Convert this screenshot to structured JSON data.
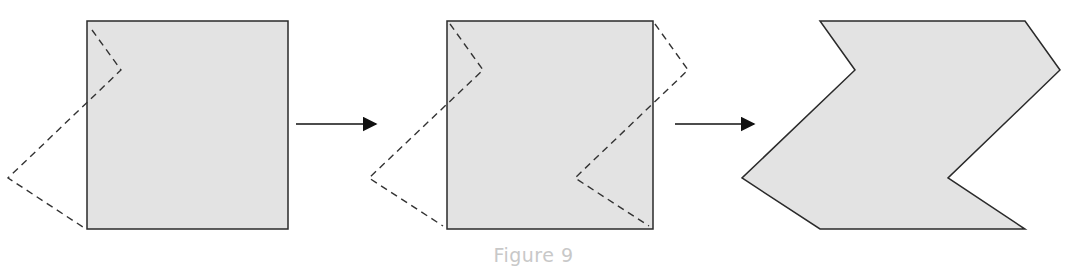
{
  "figure": {
    "caption": "Figure 9",
    "fill_color": "#e3e3e3",
    "stroke_color": "#2a2a2a",
    "caption_color": "#c8c8c8",
    "steps": [
      {
        "label": "square-with-left-cut",
        "description": "Square with dashed chevron cut outline extending to the left"
      },
      {
        "label": "square-with-both-cuts",
        "description": "Square with dashed chevron cut on left side and matching dashed cut on right side"
      },
      {
        "label": "resulting-tessellation-shape",
        "description": "Resulting chevron-shaped polygon after translating cut piece"
      }
    ],
    "arrows": [
      {
        "from": "step-1",
        "to": "step-2"
      },
      {
        "from": "step-2",
        "to": "step-3"
      }
    ]
  }
}
